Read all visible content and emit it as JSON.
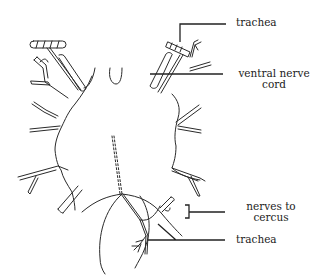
{
  "diagram": {
    "colors": {
      "line": "#2a2a2a",
      "background": "#ffffff"
    },
    "labels": {
      "trachea_top": "trachea",
      "ventral_nerve_cord_line1": "ventral  nerve",
      "ventral_nerve_cord_line2": "cord",
      "nerves_to_cercus_line1": "nerves to",
      "nerves_to_cercus_line2": "cercus",
      "trachea_bottom": "trachea"
    }
  }
}
